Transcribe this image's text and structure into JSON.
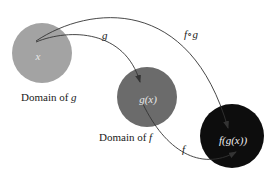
{
  "diagram": {
    "type": "function-composition",
    "colors": {
      "background": "#ffffff",
      "domain_g_fill": "#a3a3a3",
      "domain_f_fill": "#6b6b6b",
      "range_fill": "#0d0d0d",
      "arrow": "#333333",
      "text": "#1a1a1a",
      "circle_text_light": "#e8e8e8"
    },
    "nodes": [
      {
        "id": "x",
        "label": "x",
        "caption": "Domain of g"
      },
      {
        "id": "gx",
        "label": "g(x)",
        "caption": "Domain of f"
      },
      {
        "id": "fgx",
        "label": "f(g(x))",
        "caption": ""
      }
    ],
    "edges": [
      {
        "from": "x",
        "to": "gx",
        "label": "g"
      },
      {
        "from": "gx",
        "to": "fgx",
        "label": "f"
      },
      {
        "from": "x",
        "to": "fgx",
        "label": "f∘g"
      }
    ],
    "captions": {
      "domain_g_prefix": "Domain of ",
      "domain_g_var": "g",
      "domain_f_prefix": "Domain of ",
      "domain_f_var": "f"
    }
  }
}
